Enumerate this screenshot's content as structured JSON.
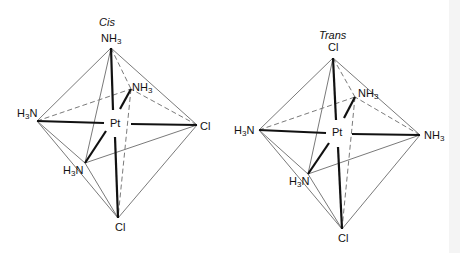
{
  "diagrams": [
    {
      "title": "Cis",
      "center": "Pt",
      "ligands": {
        "top": {
          "a": "NH",
          "sub": "3",
          "b": ""
        },
        "back": {
          "a": "NH",
          "sub": "3",
          "b": ""
        },
        "left": {
          "a": "H",
          "sub": "3",
          "b": "N"
        },
        "right": {
          "a": "Cl",
          "sub": "",
          "b": ""
        },
        "front": {
          "a": "H",
          "sub": "3",
          "b": "N"
        },
        "bottom": {
          "a": "Cl",
          "sub": "",
          "b": ""
        }
      }
    },
    {
      "title": "Trans",
      "center": "Pt",
      "ligands": {
        "top": {
          "a": "Cl",
          "sub": "",
          "b": ""
        },
        "back": {
          "a": "NH",
          "sub": "3",
          "b": ""
        },
        "left": {
          "a": "H",
          "sub": "3",
          "b": "N"
        },
        "right": {
          "a": "NH",
          "sub": "3",
          "b": ""
        },
        "front": {
          "a": "H",
          "sub": "3",
          "b": "N"
        },
        "bottom": {
          "a": "Cl",
          "sub": "",
          "b": ""
        }
      }
    }
  ],
  "colors": {
    "edge": "#7a7a7a",
    "bond": "#111111",
    "background": "#ffffff"
  }
}
